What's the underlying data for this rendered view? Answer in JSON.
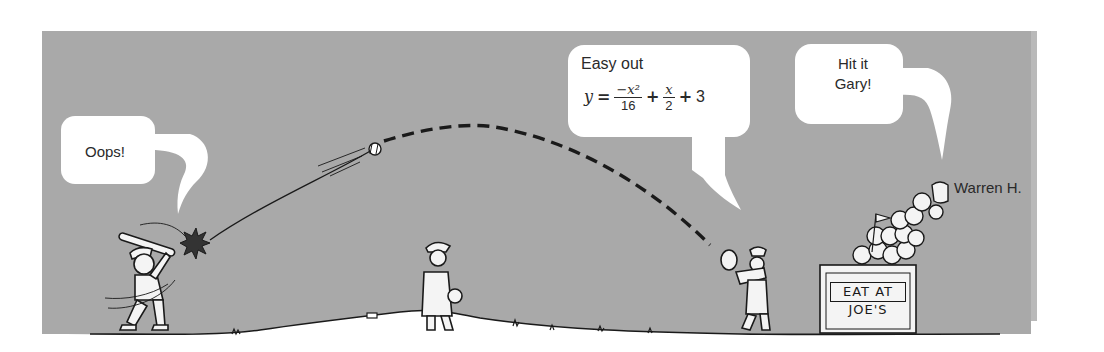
{
  "colors": {
    "panel": "#a9a9a9",
    "bubble": "#ffffff",
    "ink": "#1a1a1a",
    "ground": "#ffffff"
  },
  "bubbles": {
    "batter": {
      "text": "Oops!"
    },
    "catcher": {
      "line1": "Easy out",
      "equation": {
        "lhs": "y",
        "eq": "=",
        "term1_num": "−x²",
        "term1_den": "16",
        "plus1": "+",
        "term2_num": "x",
        "term2_den": "2",
        "plus2": "+",
        "const": "3"
      }
    },
    "crowd": {
      "line1": "Hit it",
      "line2": "Gary!"
    }
  },
  "labels": {
    "crowd_member": "Warren H.",
    "sign_line1": "EAT AT",
    "sign_line2": "JOE'S"
  },
  "icons": {
    "ball": "baseball-icon",
    "bat": "bat-icon",
    "impact": "impact-burst-icon"
  }
}
